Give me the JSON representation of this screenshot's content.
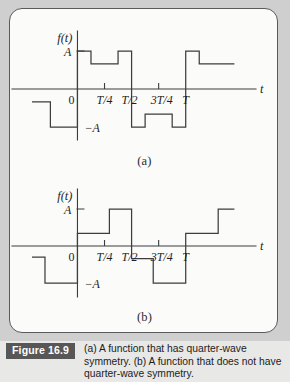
{
  "figure": {
    "badge_label": "Figure 16.9",
    "caption": "(a) A function that has quarter-wave symmetry. (b) A function that does not have quarter-wave symmetry.",
    "panel_label_a": "(a)",
    "panel_label_b": "(b)"
  },
  "colors": {
    "page_background": "#cfcfcf",
    "panel_background": "#fbfbf9",
    "panel_border": "#5a5a5a",
    "curve": "#3d3d3d",
    "axis": "#3d3d3d",
    "badge_background": "#575757",
    "badge_text": "#ffffff",
    "caption_background": "#e8e8e6",
    "text": "#1f1f1f"
  },
  "chart_data": [
    {
      "type": "line",
      "id": "plot-a",
      "title": "(a) A function that has quarter-wave symmetry.",
      "xlabel": "t",
      "ylabel": "f(t)",
      "grid": false,
      "legend": null,
      "ylim": [
        -1.35,
        1.35
      ],
      "xlim": [
        -0.42,
        1.52
      ],
      "y_tick_values": [
        1,
        -1
      ],
      "y_tick_labels": [
        "A",
        "-A"
      ],
      "x_tick_values": [
        0,
        0.25,
        0.5,
        0.75,
        1
      ],
      "x_tick_labels": [
        "0",
        "T/4",
        "T/2",
        "3T/4",
        "T"
      ],
      "axis_label_x": "t",
      "axis_label_y": "f(t)",
      "description": "Piecewise-constant square wave with quarter-wave symmetry. Levels in units of A.",
      "steps": [
        {
          "x0": -0.42,
          "x1": -0.25,
          "y": -0.34
        },
        {
          "x0": -0.25,
          "x1": 0.0,
          "y": -1.0
        },
        {
          "x0": 0.0,
          "x1": 0.125,
          "y": 1.0
        },
        {
          "x0": 0.125,
          "x1": 0.375,
          "y": 0.66
        },
        {
          "x0": 0.375,
          "x1": 0.5,
          "y": 1.0
        },
        {
          "x0": 0.5,
          "x1": 0.625,
          "y": -1.0
        },
        {
          "x0": 0.625,
          "x1": 0.875,
          "y": -0.66
        },
        {
          "x0": 0.875,
          "x1": 1.0,
          "y": -1.0
        },
        {
          "x0": 1.0,
          "x1": 1.125,
          "y": 1.0
        },
        {
          "x0": 1.125,
          "x1": 1.45,
          "y": 0.66
        }
      ]
    },
    {
      "type": "line",
      "id": "plot-b",
      "title": "(b) A function that does not have quarter-wave symmetry.",
      "xlabel": "t",
      "ylabel": "f(t)",
      "grid": false,
      "legend": null,
      "ylim": [
        -1.35,
        1.35
      ],
      "xlim": [
        -0.42,
        1.52
      ],
      "y_tick_values": [
        1,
        -1
      ],
      "y_tick_labels": [
        "A",
        "-A"
      ],
      "x_tick_values": [
        0,
        0.25,
        0.5,
        0.75,
        1
      ],
      "x_tick_labels": [
        "0",
        "T/4",
        "T/2",
        "3T/4",
        "T"
      ],
      "axis_label_x": "t",
      "axis_label_y": "f(t)",
      "description": "Piecewise-constant square wave lacking quarter-wave symmetry. Levels in units of A.",
      "steps": [
        {
          "x0": -0.42,
          "x1": -0.3,
          "y": -0.3
        },
        {
          "x0": -0.3,
          "x1": 0.0,
          "y": -1.0
        },
        {
          "x0": 0.0,
          "x1": 0.295,
          "y": 0.34
        },
        {
          "x0": 0.295,
          "x1": 0.5,
          "y": 1.0
        },
        {
          "x0": 0.5,
          "x1": 0.7,
          "y": -0.34
        },
        {
          "x0": 0.7,
          "x1": 1.0,
          "y": -1.0
        },
        {
          "x0": 1.0,
          "x1": 1.3,
          "y": 0.34
        },
        {
          "x0": 1.3,
          "x1": 1.45,
          "y": 1.0
        }
      ]
    }
  ]
}
